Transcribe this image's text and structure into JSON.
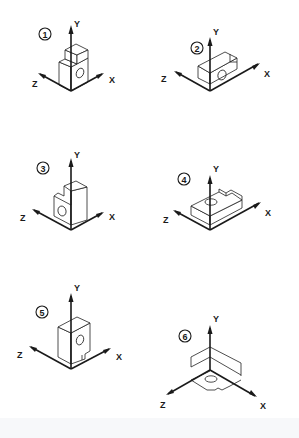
{
  "diagram": {
    "type": "isometric-orientation-exercise",
    "axis_labels": {
      "x": "X",
      "y": "Y",
      "z": "Z"
    },
    "colors": {
      "line": "#1a1a1a",
      "background": "#ffffff"
    },
    "panels": [
      {
        "number": "1",
        "axes": {
          "x": "X",
          "y": "Y",
          "z": "Z"
        }
      },
      {
        "number": "2",
        "axes": {
          "x": "X",
          "y": "Y",
          "z": "Z"
        }
      },
      {
        "number": "3",
        "axes": {
          "x": "X",
          "y": "Y",
          "z": "Z"
        }
      },
      {
        "number": "4",
        "axes": {
          "x": "X",
          "y": "Y",
          "z": "Z"
        }
      },
      {
        "number": "5",
        "axes": {
          "x": "X",
          "y": "Y",
          "z": "Z"
        }
      },
      {
        "number": "6",
        "axes": {
          "x": "X",
          "y": "Y",
          "z": "Z"
        }
      }
    ]
  }
}
